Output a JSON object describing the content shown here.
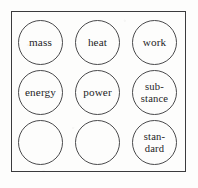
{
  "figure": {
    "kind": "circle-grid-diagram",
    "frame": {
      "border_color": "#3b3b3d",
      "background_color": "#fdfdfc"
    },
    "circle": {
      "stroke_color": "#4a4a4c",
      "text_color": "#242426",
      "diameter": 45
    },
    "grid": {
      "rows": 3,
      "columns": 3,
      "total_circles": 9,
      "labeled_circles": 7,
      "empty_circles": 2
    },
    "nodes": [
      {
        "id": "node-mass",
        "label": "mass",
        "row": 1,
        "column": 1,
        "empty": false,
        "lines": 1
      },
      {
        "id": "node-heat",
        "label": "heat",
        "row": 1,
        "column": 2,
        "empty": false,
        "lines": 1
      },
      {
        "id": "node-work",
        "label": "work",
        "row": 1,
        "column": 3,
        "empty": false,
        "lines": 1
      },
      {
        "id": "node-energy",
        "label": "energy",
        "row": 2,
        "column": 1,
        "empty": false,
        "lines": 1
      },
      {
        "id": "node-power",
        "label": "power",
        "row": 2,
        "column": 2,
        "empty": false,
        "lines": 1
      },
      {
        "id": "node-substance",
        "label": "sub-\nstance",
        "row": 2,
        "column": 3,
        "empty": false,
        "lines": 2
      },
      {
        "id": "node-empty-1",
        "label": "",
        "row": 3,
        "column": 1,
        "empty": true,
        "lines": 0
      },
      {
        "id": "node-empty-2",
        "label": "",
        "row": 3,
        "column": 2,
        "empty": true,
        "lines": 0
      },
      {
        "id": "node-standard",
        "label": "stan-\ndard",
        "row": 3,
        "column": 3,
        "empty": false,
        "lines": 2
      }
    ]
  }
}
